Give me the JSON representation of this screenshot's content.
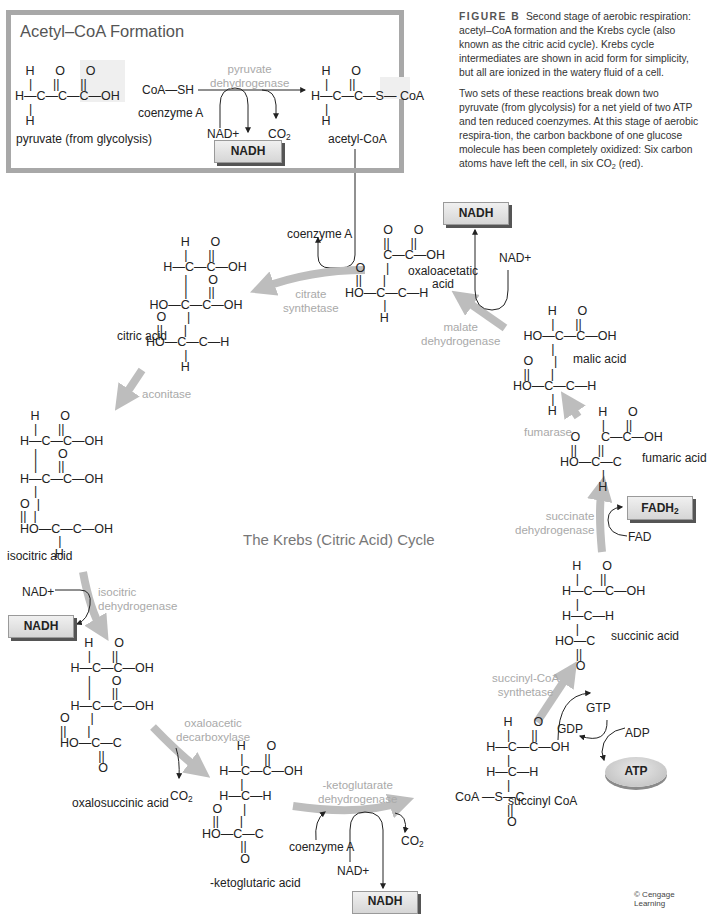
{
  "acetyl_panel": {
    "title": "Acetyl–CoA Formation",
    "pyruvate_label": "pyruvate (from glycolysis)",
    "coenzyme_formula": "CoA—SH",
    "coenzyme_label": "coenzyme A",
    "enzyme": "pyruvate\ndehydrogenase",
    "nad": "NAD+",
    "co2": "CO",
    "co2_sub": "2",
    "nadh": "NADH",
    "product_label": "acetyl-CoA"
  },
  "caption": {
    "figure_label": "FIGURE B",
    "paragraph1": "Second stage of aerobic respiration: acetyl–CoA formation and the Krebs cycle (also known as the citric acid cycle). Krebs cycle intermediates are shown in acid form for simplicity, but all are ionized in the watery fluid of a cell.",
    "paragraph2_a": "Two sets of these reactions break down two pyruvate (from glycolysis) for a net yield of two ATP and ten reduced coenzymes. At this stage of aerobic respira-tion, the carbon backbone of one glucose molecule has been completely oxidized: Six carbon atoms have left the cell, in six CO",
    "paragraph2_sub": "2",
    "paragraph2_b": " (red)."
  },
  "cycle": {
    "title": "The Krebs (Citric Acid) Cycle",
    "molecules": {
      "citric_acid": "citric acid",
      "isocitric_acid": "isocitric acid",
      "oxalosuccinic_acid": "oxalosuccinic acid",
      "ketoglutaric_acid": "-ketoglutaric acid",
      "succinyl_coa": "succinyl CoA",
      "succinic_acid": "succinic acid",
      "fumaric_acid": "fumaric acid",
      "malic_acid": "malic acid",
      "oxaloacetatic_acid": "oxaloacetatic\nacid"
    },
    "enzymes": {
      "citrate_synthetase": "citrate\nsynthetase",
      "aconitase": "aconitase",
      "isocitric_dehydrogenase": "isocitric\ndehydrogenase",
      "oxaloacetic_decarboxylase": "oxaloacetic\ndecarboxylase",
      "ketoglutarate_dehydrogenase": "-ketoglutarate\ndehydrogenase",
      "succinyl_coa_synthetase": "succinyl-CoA\nsynthetase",
      "succinate_dehydrogenase": "succinate\ndehydrogenase",
      "fumarase": "fumarase",
      "malate_dehydrogenase": "malate\ndehydrogenase"
    },
    "cofactors": {
      "coenzyme_a_top": "coenzyme A",
      "nad_malate": "NAD+",
      "nadh_malate": "NADH",
      "nad_isocitric": "NAD+",
      "nadh_isocitric": "NADH",
      "co2_oxalo": "CO",
      "co2_keto": "CO",
      "co2_sub": "2",
      "coenzyme_a_keto": "coenzyme A",
      "nad_keto": "NAD+",
      "nadh_keto": "NADH",
      "gtp": "GTP",
      "gdp": "GDP",
      "adp": "ADP",
      "atp": "ATP",
      "fad": "FAD",
      "fadh2": "FADH",
      "fadh2_sub": "2"
    }
  },
  "formulas": {
    "pyruvate": [
      "   H      O      O",
      "    |      ||      ||",
      "H—C—C—C—OH",
      "    |",
      "   H"
    ],
    "acetyl_coa": [
      "   H      O",
      "    |      ||",
      "H—C—C—S— CoA",
      "    |",
      "   H"
    ],
    "citric": [
      "          H      O",
      "           |      ||",
      "     H—C—C—OH",
      "           |      O",
      "           |      ||",
      " HO—C—C—OH",
      "   O      |",
      "   ||      |",
      "HO—C—C—H",
      "           |",
      "          H"
    ],
    "isocitric": [
      "   H      O",
      "    |      ||",
      "H—C—C—OH",
      "    |      O",
      "    |      ||",
      "H—C—C—OH",
      "    |",
      "O  |",
      "||  |",
      "HO—C—C—OH",
      "           |",
      "          H"
    ],
    "oxalosuccinic": [
      "       H      O",
      "        |      ||",
      "   H—C—C—OH",
      "        |      O",
      "        |      ||",
      "   H—C—C—OH",
      "O      |",
      "||      |",
      "HO—C—C",
      "           ||",
      "           O"
    ],
    "ketoglutaric": [
      "          H      O",
      "           |      ||",
      "     H—C—C—OH",
      "           |",
      "     H—C—H",
      "   O      |",
      "   ||      |",
      "HO—C—C",
      "           ||",
      "           O"
    ],
    "succinyl": [
      "              H      O",
      "               |      ||",
      "         H—C—C—OH",
      "               |",
      "         H—C—H",
      "               |",
      "CoA —S—C",
      "               ||",
      "               O"
    ],
    "succinic": [
      "     H      O",
      "      |      ||",
      "  H—C—C—OH",
      "      |",
      "  H—C—H",
      "      |",
      "HO—C",
      "      ||",
      "      O"
    ],
    "fumaric": [
      "           H      O",
      "            |      ||",
      "   O      C—C—OH",
      "   ||      ||",
      "HO—C—C",
      "            |",
      "           H"
    ],
    "malic": [
      "          H      O",
      "           |      ||",
      "   HO—C—C—OH",
      "           |",
      "   O      |",
      "   ||      |",
      "HO—C—C—H",
      "           |",
      "          H"
    ],
    "oxaloacetatic": [
      "           O      O",
      "           ||      ||",
      "           C—C—OH",
      "   O      |",
      "   ||      |",
      "HO—C—C—H",
      "           |",
      "          H"
    ]
  },
  "footer": {
    "copyright": "© Cengage Learning"
  },
  "colors": {
    "frame_gray": "#a8a8a8",
    "enzyme_text": "#a9a9a9",
    "arrow_gray": "#bdbdbd",
    "box_fill": "#e2e2e2",
    "box_shadow": "#555555"
  }
}
